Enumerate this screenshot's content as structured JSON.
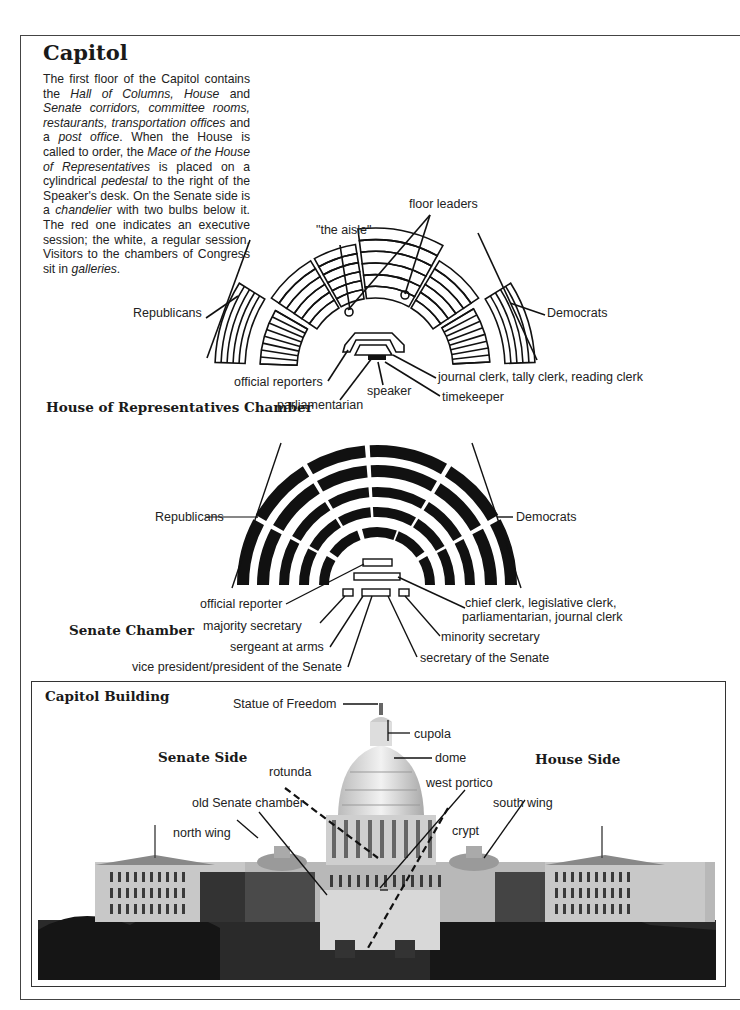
{
  "page": {
    "title": "Capitol",
    "intro_segments": [
      {
        "t": "The first floor of the Capitol contains the ",
        "i": false
      },
      {
        "t": "Hall of Columns, House",
        "i": true
      },
      {
        "t": " and ",
        "i": false
      },
      {
        "t": "Senate corridors, committee rooms, restaurants, transportation offices",
        "i": true
      },
      {
        "t": " and a ",
        "i": false
      },
      {
        "t": "post office",
        "i": true
      },
      {
        "t": ". When the House is called to order, the ",
        "i": false
      },
      {
        "t": "Mace of the House of Representatives",
        "i": true
      },
      {
        "t": " is placed on a cylindrical ",
        "i": false
      },
      {
        "t": "pedestal",
        "i": true
      },
      {
        "t": " to the right of the Speaker's desk. On the Senate side is a ",
        "i": false
      },
      {
        "t": "chandelier",
        "i": true
      },
      {
        "t": " with two bulbs below it. The red one indicates an executive session; the white, a regular session. Visitors to the chambers of Congress sit in ",
        "i": false
      },
      {
        "t": "galleries",
        "i": true
      },
      {
        "t": ".",
        "i": false
      }
    ]
  },
  "house_chamber": {
    "heading": "House of Representatives Chamber",
    "labels": {
      "floor_leaders": "floor leaders",
      "the_aisle": "\"the aisle\"",
      "republicans": "Republicans",
      "democrats": "Democrats",
      "official_reporters": "official reporters",
      "speaker": "speaker",
      "parliamentarian": "parliamentarian",
      "journal_clerk": "journal clerk, tally clerk, reading clerk",
      "timekeeper": "timekeeper"
    }
  },
  "senate_chamber": {
    "heading": "Senate Chamber",
    "labels": {
      "republicans": "Republicans",
      "democrats": "Democrats",
      "official_reporter": "official reporter",
      "chief_clerk_line1": "chief clerk, legislative clerk,",
      "chief_clerk_line2": "parliamentarian, journal clerk",
      "majority_secretary": "majority secretary",
      "minority_secretary": "minority secretary",
      "sergeant_at_arms": "sergeant at arms",
      "secretary_of_senate": "secretary of the Senate",
      "vice_president": "vice president/president of the Senate"
    }
  },
  "capitol_building": {
    "heading": "Capitol Building",
    "senate_side": "Senate Side",
    "house_side": "House Side",
    "labels": {
      "statue_of_freedom": "Statue of Freedom",
      "cupola": "cupola",
      "dome": "dome",
      "rotunda": "rotunda",
      "west_portico": "west portico",
      "old_senate_chamber": "old Senate chamber",
      "south_wing": "south wing",
      "north_wing": "north wing",
      "crypt": "crypt"
    }
  }
}
